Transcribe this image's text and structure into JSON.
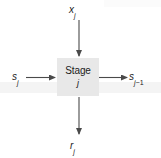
{
  "diagram": {
    "type": "block-diagram",
    "block": {
      "label_line1": "Stage",
      "label_line2": "j",
      "fill_color": "#e8e8e8"
    },
    "labels": {
      "top_input": {
        "base": "x",
        "sub": "j",
        "text": "x_j"
      },
      "left_input": {
        "base": "s",
        "sub": "j",
        "text": "s_j"
      },
      "right_output": {
        "base": "s",
        "sub": "j",
        "op": "−",
        "sub2": "1",
        "text": "s_j-1"
      },
      "bottom_output": {
        "base": "r",
        "sub": "j",
        "text": "r_j"
      }
    },
    "arrows": [
      {
        "name": "top-input-arrow",
        "direction": "down",
        "from": [
          79,
          20
        ],
        "to": [
          79,
          57
        ]
      },
      {
        "name": "left-input-arrow",
        "direction": "right",
        "from": [
          26,
          77
        ],
        "to": [
          56,
          77
        ]
      },
      {
        "name": "right-output-arrow",
        "direction": "right",
        "from": [
          99,
          77
        ],
        "to": [
          127,
          77
        ]
      },
      {
        "name": "bottom-output-arrow",
        "direction": "down",
        "from": [
          79,
          97
        ],
        "to": [
          79,
          134
        ]
      }
    ],
    "colors": {
      "stroke": "#4a4a4a",
      "text": "#1b1b1b",
      "background": "#ffffff"
    }
  }
}
